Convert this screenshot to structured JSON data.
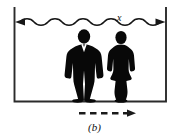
{
  "figure": {
    "panel_label": "(b)",
    "dimension_label": "x",
    "caption_alt": "Two silhouetted figures standing inside a container, separated by distance x, with a dashed arrow indicating rightward motion",
    "colors": {
      "ink": "#111111",
      "background": "#ffffff",
      "silhouette": "#080808",
      "wall": "#2b2b2b"
    },
    "elements": {
      "container_name": "container-walls",
      "dimension_arrow_name": "wavy-dimension-arrow",
      "motion_arrow_name": "dashed-motion-arrow",
      "left_figure_name": "male-silhouette",
      "right_figure_name": "female-silhouette"
    },
    "geometry": {
      "left_wall_x": 14,
      "right_wall_x": 166,
      "top_y": 7,
      "floor_y": 101,
      "dimension_line_y": 22,
      "motion_arrow_y": 113,
      "panel_label_y": 123
    },
    "annotations": {
      "motion_direction": "right",
      "dash_count": 5,
      "wave_count": 11
    }
  }
}
